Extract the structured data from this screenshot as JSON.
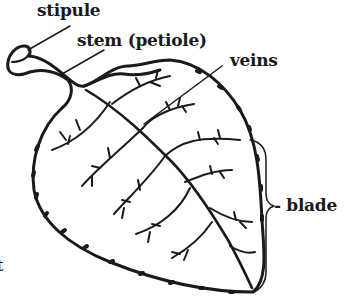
{
  "diagram": {
    "title": "",
    "labels": [
      {
        "id": "stipule",
        "text": "stipule"
      },
      {
        "id": "stem",
        "text": "stem (petiole)"
      },
      {
        "id": "veins",
        "text": "veins"
      },
      {
        "id": "blade",
        "text": "- blade"
      },
      {
        "id": "cut-off",
        "text": "t"
      }
    ]
  }
}
